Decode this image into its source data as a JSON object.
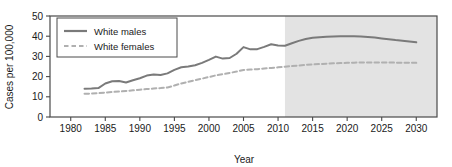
{
  "chart_data": {
    "type": "line",
    "title": "",
    "xlabel": "Year",
    "ylabel": "Cases per 100,000",
    "xlim": [
      1977,
      2033
    ],
    "ylim": [
      0,
      50
    ],
    "xticks": [
      1980,
      1985,
      1990,
      1995,
      2000,
      2005,
      2010,
      2015,
      2020,
      2025,
      2030
    ],
    "yticks": [
      0,
      10,
      20,
      30,
      40,
      50
    ],
    "grid": false,
    "legend_position": "top-left",
    "projection_start_year": 2011,
    "projection_shading": "#e3e3e3",
    "series": [
      {
        "name": "White males",
        "style": "solid",
        "color": "#7a7a7a",
        "x": [
          1982,
          1983,
          1984,
          1985,
          1986,
          1987,
          1988,
          1989,
          1990,
          1991,
          1992,
          1993,
          1994,
          1995,
          1996,
          1997,
          1998,
          1999,
          2000,
          2001,
          2002,
          2003,
          2004,
          2005,
          2006,
          2007,
          2008,
          2009,
          2010,
          2011,
          2012,
          2013,
          2014,
          2015,
          2016,
          2017,
          2018,
          2019,
          2020,
          2021,
          2022,
          2023,
          2024,
          2025,
          2026,
          2027,
          2028,
          2029,
          2030
        ],
        "values": [
          14.0,
          14.1,
          14.3,
          16.6,
          17.7,
          17.8,
          17.1,
          18.2,
          19.2,
          20.5,
          21.0,
          20.8,
          21.6,
          23.3,
          24.6,
          25.0,
          25.6,
          26.8,
          28.3,
          29.9,
          28.9,
          29.2,
          31.3,
          34.6,
          33.5,
          33.6,
          34.7,
          36.0,
          35.4,
          35.3,
          36.5,
          37.7,
          38.6,
          39.2,
          39.5,
          39.7,
          39.9,
          40.0,
          40.0,
          40.0,
          39.9,
          39.6,
          39.3,
          38.9,
          38.5,
          38.1,
          37.8,
          37.4,
          37.0
        ]
      },
      {
        "name": "White females",
        "style": "dashed",
        "color": "#b0b0b0",
        "x": [
          1982,
          1983,
          1984,
          1985,
          1986,
          1987,
          1988,
          1989,
          1990,
          1991,
          1992,
          1993,
          1994,
          1995,
          1996,
          1997,
          1998,
          1999,
          2000,
          2001,
          2002,
          2003,
          2004,
          2005,
          2006,
          2007,
          2008,
          2009,
          2010,
          2011,
          2012,
          2013,
          2014,
          2015,
          2016,
          2017,
          2018,
          2019,
          2020,
          2021,
          2022,
          2023,
          2024,
          2025,
          2026,
          2027,
          2028,
          2029,
          2030
        ],
        "values": [
          11.5,
          11.6,
          11.8,
          12.1,
          12.4,
          12.6,
          12.9,
          13.2,
          13.5,
          13.8,
          14.1,
          14.3,
          14.6,
          15.6,
          16.6,
          17.4,
          18.2,
          19.0,
          19.8,
          20.6,
          21.2,
          21.8,
          22.5,
          23.3,
          23.5,
          23.7,
          24.0,
          24.3,
          24.6,
          24.9,
          25.2,
          25.5,
          25.8,
          26.0,
          26.2,
          26.4,
          26.6,
          26.7,
          26.8,
          26.9,
          27.0,
          27.0,
          27.0,
          27.0,
          27.0,
          26.9,
          26.9,
          26.9,
          26.8
        ]
      }
    ]
  },
  "legend": {
    "items": [
      {
        "label": "White males",
        "style": "solid"
      },
      {
        "label": "White females",
        "style": "dashed"
      }
    ]
  }
}
